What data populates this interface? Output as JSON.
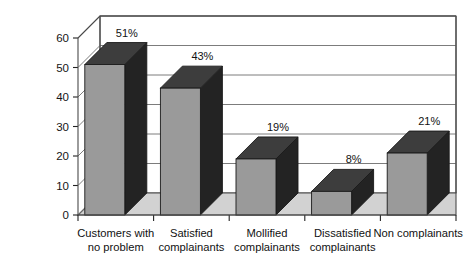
{
  "chart_data": {
    "type": "bar",
    "title": "",
    "subtitle": "",
    "xlabel": "",
    "ylabel": "% definitely will repurchase",
    "ylim": [
      0,
      60
    ],
    "ytick_step": 10,
    "yticks": [
      "0",
      "10",
      "20",
      "30",
      "40",
      "50",
      "60"
    ],
    "grid": true,
    "legend": false,
    "legend_position": "none",
    "three_d": true,
    "categories": [
      "Customers with no problem",
      "Satisfied complainants",
      "Mollified complainants",
      "Dissatisfied complainants",
      "Non complainants"
    ],
    "category_lines": [
      [
        "Customers with",
        "no problem"
      ],
      [
        "Satisfied",
        "complainants"
      ],
      [
        "Mollified",
        "complainants"
      ],
      [
        "Dissatisfied",
        "complainants"
      ],
      [
        "Non complainants",
        ""
      ]
    ],
    "values": [
      51,
      43,
      19,
      8,
      21
    ],
    "data_labels": [
      "51%",
      "43%",
      "19%",
      "8%",
      "21%"
    ],
    "colors": {
      "bar_front": "#9a9a9a",
      "bar_side": "#232323",
      "bar_top": "#3d3d3d",
      "bar_outline": "#1a1a1a",
      "floor": "#d2d2d2",
      "wall": "#ffffff",
      "gridline": "#6d6d6d",
      "frame": "#4a4a4a",
      "text": "#111111",
      "background": "#ffffff"
    }
  }
}
